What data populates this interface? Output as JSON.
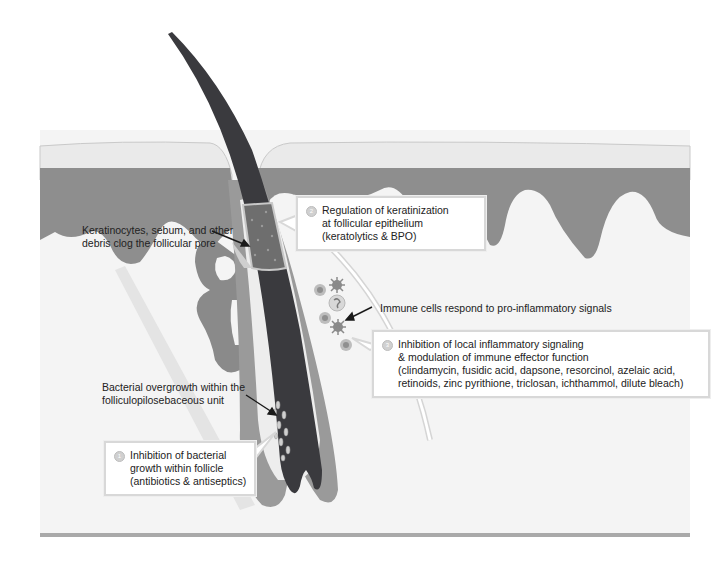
{
  "diagram": {
    "type": "anatomical-illustration",
    "colors": {
      "background": "#ffffff",
      "stratum_corneum": "#ececec",
      "epidermis": "#8e8e8e",
      "dermis": "#f3f3f3",
      "hair_shaft": "#3a3a3e",
      "follicle_sheath": "#9a9a9a",
      "sebaceous_gland": "#8a8a8a",
      "plug": "#6a6a6a",
      "box_border": "#d8d8d8",
      "base_line": "#9b9b9b"
    }
  },
  "annotations": {
    "clog": {
      "lines": [
        "Keratinocytes, sebum, and other",
        "debris clog the follicular pore"
      ]
    },
    "immune": {
      "lines": [
        "Immune cells respond to pro-inflammatory signals"
      ]
    },
    "bacterial": {
      "lines": [
        "Bacterial overgrowth within the",
        "folliculopilosebaceous unit"
      ]
    }
  },
  "callouts": {
    "keratinization": {
      "badge": "2",
      "lines": [
        "Regulation of keratinization",
        "at follicular epithelium",
        "(keratolytics & BPO)"
      ]
    },
    "inflammation": {
      "badge": "3",
      "lines": [
        "Inhibition of local inflammatory signaling",
        "& modulation of immune effector function",
        "(clindamycin, fusidic acid, dapsone, resorcinol, azelaic acid,",
        "retinoids, zinc pyrithione, triclosan, ichthammol, dilute bleach)"
      ]
    },
    "bacterial_growth": {
      "badge": "1",
      "lines": [
        "Inhibition of bacterial",
        "growth within follicle",
        "(antibiotics & antiseptics)"
      ]
    }
  }
}
